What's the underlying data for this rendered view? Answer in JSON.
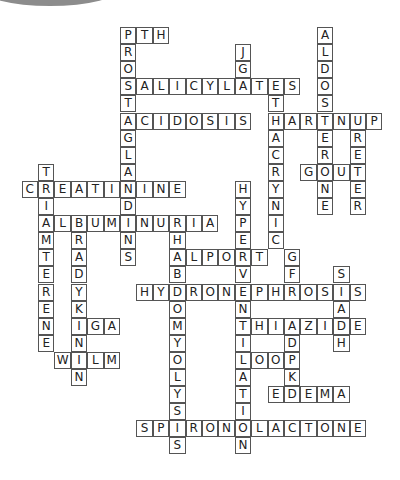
{
  "puzzle": {
    "title": "Renal crossword",
    "grid": {
      "origin_x": 120,
      "origin_y": 27,
      "cell_w": 16.4,
      "cell_h": 17.1
    },
    "colors": {
      "border": "#555555",
      "text": "#222222",
      "background": "#ffffff",
      "blob": "#8c8c8c"
    },
    "words": [
      {
        "word": "PTH",
        "col": 0,
        "row": 0,
        "dir": "across"
      },
      {
        "word": "PROSTAGLANDINS",
        "col": 0,
        "row": 0,
        "dir": "down"
      },
      {
        "word": "SALICYLATES",
        "col": 0,
        "row": 3,
        "dir": "across"
      },
      {
        "word": "JGA",
        "col": 7,
        "row": 1,
        "dir": "down"
      },
      {
        "word": "ACIDOSIS",
        "col": 0,
        "row": 5,
        "dir": "across"
      },
      {
        "word": "ETHACRYNIC",
        "col": 9,
        "row": 3,
        "dir": "down"
      },
      {
        "word": "HARTNUP",
        "col": 9,
        "row": 5,
        "dir": "across"
      },
      {
        "word": "ALDOSTERONE",
        "col": 12,
        "row": 0,
        "dir": "down"
      },
      {
        "word": "URETER",
        "col": 14,
        "row": 5,
        "dir": "down"
      },
      {
        "word": "GOUT",
        "col": 11,
        "row": 8,
        "dir": "across"
      },
      {
        "word": "CREATININE",
        "col": -6,
        "row": 9,
        "dir": "across"
      },
      {
        "word": "TRIAMTERENE",
        "col": -5,
        "row": 8,
        "dir": "down"
      },
      {
        "word": "ALBUMINURIA",
        "col": -5,
        "row": 11,
        "dir": "across"
      },
      {
        "word": "BRADYKININ",
        "col": -3,
        "row": 11,
        "dir": "down"
      },
      {
        "word": "IGA",
        "col": -3,
        "row": 17,
        "dir": "across"
      },
      {
        "word": "WILM",
        "col": -4,
        "row": 19,
        "dir": "across"
      },
      {
        "word": "RHABDOMYOLYSIS",
        "col": 3,
        "row": 11,
        "dir": "down"
      },
      {
        "word": "ALPORT",
        "col": 3,
        "row": 13,
        "dir": "across"
      },
      {
        "word": "HYPERVENTILATION",
        "col": 7,
        "row": 9,
        "dir": "down"
      },
      {
        "word": "HYDRONEPHROSIS",
        "col": 1,
        "row": 15,
        "dir": "across"
      },
      {
        "word": "GFR",
        "col": 10,
        "row": 13,
        "dir": "down"
      },
      {
        "word": "SIADH",
        "col": 13,
        "row": 14,
        "dir": "down"
      },
      {
        "word": "THIAZIDE",
        "col": 7,
        "row": 17,
        "dir": "across"
      },
      {
        "word": "ADPKD",
        "col": 10,
        "row": 17,
        "dir": "down"
      },
      {
        "word": "LOOP",
        "col": 7,
        "row": 19,
        "dir": "across"
      },
      {
        "word": "EDEMA",
        "col": 9,
        "row": 21,
        "dir": "across"
      },
      {
        "word": "SPIRONOLACTONE",
        "col": 1,
        "row": 23,
        "dir": "across"
      }
    ]
  }
}
